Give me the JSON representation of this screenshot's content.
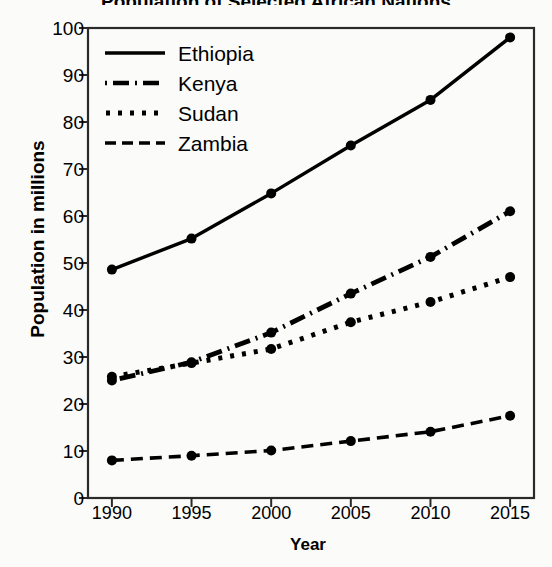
{
  "chart_data": {
    "type": "line",
    "title": "Population of Selected African Nations",
    "xlabel": "Year",
    "ylabel": "Population in millions",
    "categories": [
      1990,
      1995,
      2000,
      2005,
      2010,
      2015
    ],
    "xticklabels": [
      "1990",
      "1995",
      "2000",
      "2005",
      "2010",
      "2015"
    ],
    "yticklabels": [
      "0",
      "10",
      "20",
      "30",
      "40",
      "50",
      "60",
      "70",
      "80",
      "90",
      "100"
    ],
    "yticks": [
      0,
      10,
      20,
      30,
      40,
      50,
      60,
      70,
      80,
      90,
      100
    ],
    "ylim": [
      0,
      100
    ],
    "xlim": [
      1988.5,
      2016.5
    ],
    "grid": false,
    "legend_position": "upper left",
    "marker": "circle",
    "series": [
      {
        "name": "Ethiopia",
        "linestyle": "solid",
        "color": "#000000",
        "values": [
          48.6,
          55.2,
          64.8,
          75.0,
          84.7,
          98.0
        ]
      },
      {
        "name": "Kenya",
        "linestyle": "dashdot",
        "color": "#000000",
        "values": [
          25.0,
          28.9,
          35.2,
          43.5,
          51.3,
          61.0
        ]
      },
      {
        "name": "Sudan",
        "linestyle": "dotted",
        "color": "#000000",
        "values": [
          25.8,
          28.7,
          31.7,
          37.4,
          41.7,
          47.0
        ]
      },
      {
        "name": "Zambia",
        "linestyle": "dashed",
        "color": "#000000",
        "values": [
          8.0,
          9.0,
          10.1,
          12.1,
          14.1,
          17.5
        ]
      }
    ]
  },
  "legend": {
    "items": [
      {
        "label": "Ethiopia"
      },
      {
        "label": "Kenya"
      },
      {
        "label": "Sudan"
      },
      {
        "label": "Zambia"
      }
    ]
  }
}
